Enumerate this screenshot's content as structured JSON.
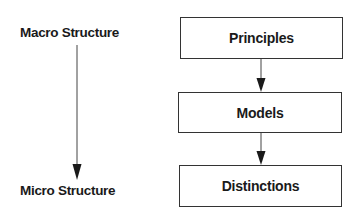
{
  "diagram": {
    "scale": {
      "top_label": "Macro Structure",
      "bottom_label": "Micro Structure"
    },
    "nodes": [
      {
        "id": "principles",
        "label": "Principles"
      },
      {
        "id": "models",
        "label": "Models"
      },
      {
        "id": "distinctions",
        "label": "Distinctions"
      }
    ],
    "edges": [
      {
        "from": "principles",
        "to": "models"
      },
      {
        "from": "models",
        "to": "distinctions"
      },
      {
        "from": "macro-structure",
        "to": "micro-structure"
      }
    ]
  }
}
